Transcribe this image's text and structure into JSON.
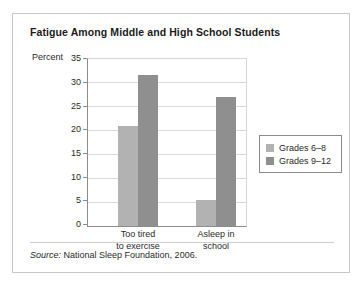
{
  "figure": {
    "title": "Fatigue Among Middle and High School Students",
    "source_prefix": "Source:",
    "source_text": "National Sleep Foundation, 2006."
  },
  "legend": {
    "items": [
      {
        "label": "Grades 6–8",
        "color": "#b2b2b2"
      },
      {
        "label": "Grades 9–12",
        "color": "#8f8f8f"
      }
    ]
  },
  "chart_data": {
    "type": "bar",
    "title": "Fatigue Among Middle and High School Students",
    "xlabel": "",
    "ylabel": "Percent",
    "ylim": [
      0,
      35
    ],
    "yticks": [
      0,
      5,
      10,
      15,
      20,
      25,
      30,
      35
    ],
    "ytick_labels": [
      "0",
      "5",
      "10",
      "15",
      "20",
      "25",
      "30",
      "35"
    ],
    "grid": true,
    "legend_position": "right-outside",
    "categories": [
      "Too tired to exercise",
      "Asleep in school"
    ],
    "category_lines": [
      [
        "Too tired",
        "to exercise"
      ],
      [
        "Asleep in",
        "school"
      ]
    ],
    "series": [
      {
        "name": "Grades 6–8",
        "color": "#b2b2b2",
        "values": [
          21,
          5.5
        ]
      },
      {
        "name": "Grades 9–12",
        "color": "#8f8f8f",
        "values": [
          31.7,
          27
        ]
      }
    ],
    "source": "Source: National Sleep Foundation, 2006."
  }
}
